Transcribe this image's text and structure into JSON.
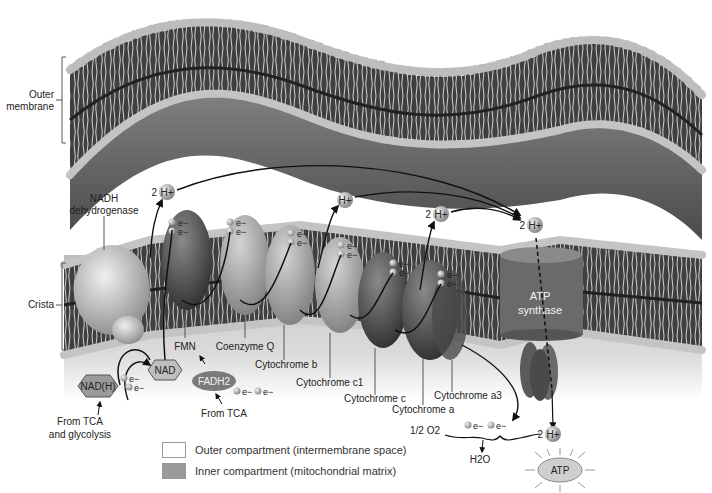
{
  "diagram": {
    "regions": {
      "outer_membrane": "Outer membrane",
      "crista": "Crista"
    },
    "labels": {
      "outer_line1": "Outer",
      "outer_line2": "membrane",
      "crista": "Crista",
      "nadh_dh_line1": "NADH",
      "nadh_dh_line2": "dehydrogenase",
      "fmn": "FMN",
      "coenzyme_q": "Coenzyme Q",
      "cyt_b": "Cytochrome b",
      "cyt_c1": "Cytochrome c1",
      "cyt_c": "Cytochrome c",
      "cyt_a": "Cytochrome a",
      "cyt_a3": "Cytochrome a3",
      "atp_synthase_line1": "ATP",
      "atp_synthase_line2": "synthase",
      "nad": "NAD",
      "nadh": "NAD(H)",
      "fadh2": "FADH2",
      "from_tca_1": "From TCA",
      "from_tca_2_line1": "From TCA",
      "from_tca_2_line2": "and glycolysis",
      "half_o2": "1/2 O2",
      "h2o": "H2O",
      "atp": "ATP",
      "h_plus": "H+",
      "two": "2",
      "electron": "e−"
    },
    "protons": [
      {
        "id": "h1",
        "count": "2",
        "label": "H+"
      },
      {
        "id": "h2",
        "count": "",
        "label": "H+"
      },
      {
        "id": "h3",
        "count": "2",
        "label": "H+"
      },
      {
        "id": "h4",
        "count": "2",
        "label": "H+"
      },
      {
        "id": "h5",
        "count": "2",
        "label": "H+"
      }
    ],
    "legend": [
      {
        "label": "Outer compartment (intermembrane space)",
        "color": "#ffffff"
      },
      {
        "label": "Inner compartment (mitochondrial matrix)",
        "color": "#9a9a9a"
      }
    ],
    "colors": {
      "membrane_dark": "#4a4a4a",
      "head_light": "#c8c8c8",
      "matrix": "#c9c9c9",
      "protein_light": "#b5b5b5",
      "protein_dark": "#5a5a5a"
    }
  }
}
